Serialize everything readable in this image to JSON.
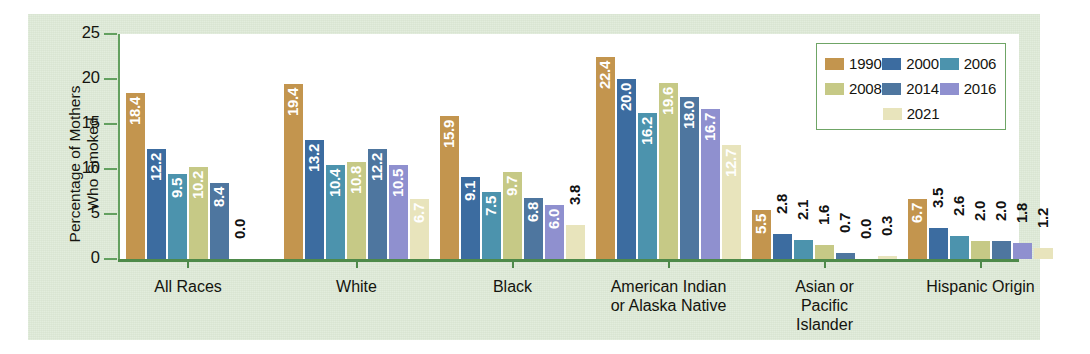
{
  "chart_data": {
    "type": "bar",
    "title": "",
    "xlabel": "",
    "ylabel": "Percentage of Mothers Who Smoked",
    "ylim": [
      0,
      25
    ],
    "yticks": [
      0,
      5,
      10,
      15,
      20,
      25
    ],
    "grid": false,
    "legend_position": "top-right",
    "categories": [
      "All Races",
      "White",
      "Black",
      "American Indian or Alaska Native",
      "Asian or Pacific Islander",
      "Hispanic Origin"
    ],
    "series": [
      {
        "name": "1990",
        "color": "#c3954e",
        "values": [
          18.4,
          19.4,
          15.9,
          22.4,
          5.5,
          6.7
        ]
      },
      {
        "name": "2000",
        "color": "#3c6ca0",
        "values": [
          12.2,
          13.2,
          9.1,
          20.0,
          2.8,
          3.5
        ]
      },
      {
        "name": "2006",
        "color": "#4c93ad",
        "values": [
          9.5,
          10.4,
          7.5,
          16.2,
          2.1,
          2.6
        ]
      },
      {
        "name": "2008",
        "color": "#c6c986",
        "values": [
          10.2,
          10.8,
          9.7,
          19.6,
          1.6,
          2.0
        ]
      },
      {
        "name": "2014",
        "color": "#4e769f",
        "values": [
          8.4,
          12.2,
          6.8,
          18.0,
          0.7,
          2.0
        ]
      },
      {
        "name": "2016",
        "color": "#8f90cf",
        "values": [
          0.0,
          10.5,
          6.0,
          16.7,
          0.0,
          1.8
        ]
      },
      {
        "name": "2021",
        "color": "#e8e4bc",
        "values": [
          0.0,
          6.7,
          3.8,
          12.7,
          0.3,
          1.2
        ]
      }
    ],
    "bar_labels": [
      [
        "18.4",
        "12.2",
        "9.5",
        "10.2",
        "8.4",
        "0.0"
      ],
      [
        "19.4",
        "13.2",
        "10.4",
        "10.8",
        "12.2",
        "10.5",
        "6.7"
      ],
      [
        "15.9",
        "9.1",
        "7.5",
        "9.7",
        "6.8",
        "6.0",
        "3.8"
      ],
      [
        "22.4",
        "20.0",
        "16.2",
        "19.6",
        "18.0",
        "16.7",
        "12.7"
      ],
      [
        "5.5",
        "2.8",
        "2.1",
        "1.6",
        "0.7",
        "0.0",
        "0.3"
      ],
      [
        "6.7",
        "3.5",
        "2.6",
        "2.0",
        "2.0",
        "1.8",
        "1.2"
      ]
    ]
  },
  "axis": {
    "y_title_line1": "Percentage of Mothers",
    "y_title_line2": "Who Smoked",
    "tick_0": "0",
    "tick_5": "5",
    "tick_10": "10",
    "tick_15": "15",
    "tick_20": "20",
    "tick_25": "25"
  },
  "groups": [
    {
      "label_line1": "All Races",
      "label_line2": "",
      "label_line3": ""
    },
    {
      "label_line1": "White",
      "label_line2": "",
      "label_line3": ""
    },
    {
      "label_line1": "Black",
      "label_line2": "",
      "label_line3": ""
    },
    {
      "label_line1": "American Indian",
      "label_line2": "or Alaska Native",
      "label_line3": ""
    },
    {
      "label_line1": "Asian or",
      "label_line2": "Pacific",
      "label_line3": "Islander"
    },
    {
      "label_line1": "Hispanic Origin",
      "label_line2": "",
      "label_line3": ""
    }
  ],
  "legend": {
    "items": [
      {
        "label": "1990",
        "color": "#c3954e"
      },
      {
        "label": "2000",
        "color": "#3c6ca0"
      },
      {
        "label": "2006",
        "color": "#4c93ad"
      },
      {
        "label": "2008",
        "color": "#c6c986"
      },
      {
        "label": "2014",
        "color": "#4e769f"
      },
      {
        "label": "2016",
        "color": "#8f90cf"
      },
      {
        "label": "2021",
        "color": "#e8e4bc"
      }
    ]
  },
  "theme": {
    "panel_background": "#dde9d6",
    "plot_background": "#ffffff",
    "axis_color": "#4e8a4a",
    "legend_border": "#6fa566"
  }
}
